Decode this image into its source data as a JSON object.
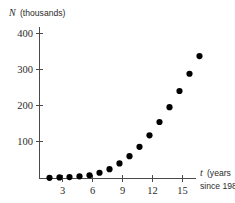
{
  "chart_data": {
    "type": "scatter",
    "title": "",
    "subtitle": "",
    "ylabel_var": "N",
    "ylabel_units": "(thousands)",
    "xlabel_var": "t",
    "xlabel_units_line1": "(years",
    "xlabel_units_line2": "since 1980)",
    "xlabel": "t (years since 1980)",
    "ylabel": "N (thousands)",
    "xlim": [
      0,
      16.5
    ],
    "ylim": [
      0,
      420
    ],
    "grid": false,
    "legend": null,
    "x_ticks": [
      3,
      6,
      9,
      12,
      15
    ],
    "x_tick_labels": [
      "3",
      "6",
      "9",
      "12",
      "15"
    ],
    "y_ticks": [
      100,
      200,
      300,
      400
    ],
    "y_tick_labels": [
      "100",
      "200",
      "300",
      "400"
    ],
    "marker": "filled-circle",
    "marker_color": "#000000",
    "marker_size_px": 3.1,
    "x": [
      1,
      2,
      3,
      4,
      5,
      6,
      7,
      8,
      9,
      10,
      11,
      12,
      13,
      14,
      15
    ],
    "values": [
      2,
      3,
      4,
      6,
      9,
      16,
      26,
      42,
      62,
      88,
      120,
      157,
      198,
      243,
      291
    ],
    "points": [
      {
        "t": 1,
        "N": 2
      },
      {
        "t": 2,
        "N": 3
      },
      {
        "t": 3,
        "N": 4
      },
      {
        "t": 4,
        "N": 6
      },
      {
        "t": 5,
        "N": 9
      },
      {
        "t": 6,
        "N": 16
      },
      {
        "t": 7,
        "N": 26
      },
      {
        "t": 8,
        "N": 42
      },
      {
        "t": 9,
        "N": 62
      },
      {
        "t": 10,
        "N": 88
      },
      {
        "t": 11,
        "N": 120
      },
      {
        "t": 12,
        "N": 157
      },
      {
        "t": 13,
        "N": 198
      },
      {
        "t": 14,
        "N": 243
      },
      {
        "t": 15,
        "N": 291
      },
      {
        "t": 16,
        "N": 340
      }
    ],
    "axis_color": "#4a4a4a"
  }
}
